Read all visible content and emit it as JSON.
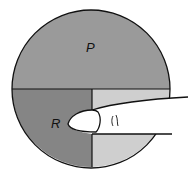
{
  "diagram": {
    "labels": {
      "top_region": "P",
      "bottom_left_region": "R"
    },
    "colors": {
      "top_region": "#9a9a9a",
      "bottom_left_region": "#858585",
      "bottom_right_region": "#cfcfcf",
      "finger": "#ffffff",
      "outline": "#111111"
    }
  }
}
